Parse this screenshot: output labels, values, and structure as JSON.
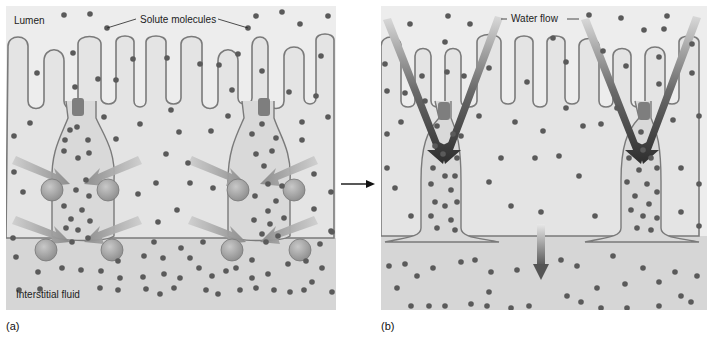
{
  "panels": [
    {
      "id": "a",
      "letter": "(a)",
      "labels": {
        "lumen": "Lumen",
        "solute": "Solute molecules",
        "interstitial": "Interstitial fluid"
      }
    },
    {
      "id": "b",
      "letter": "(b)",
      "labels": {
        "water_flow": "Water flow"
      }
    }
  ],
  "colors": {
    "background": "#ececec",
    "cell": "#e2e2e2",
    "interstitial": "#d4d4d4",
    "membrane": "#7a7a7a",
    "solute": "#5a5a5a",
    "junction": "#7e7e7e",
    "pump": "#a8a8a8",
    "arrow_a": "#9a9a9a",
    "arrow_b": "#3a3a3a"
  },
  "transition_arrow": "→"
}
